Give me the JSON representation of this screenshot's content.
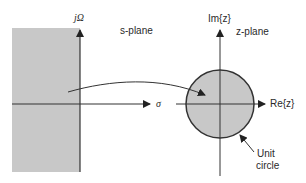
{
  "s_plane": {
    "title": "s-plane",
    "imag_axis_label": "jΩ",
    "real_axis_label": "σ",
    "shaded_region": "left-half plane",
    "shade_color": "#c8c8c8"
  },
  "z_plane": {
    "title": "z-plane",
    "imag_axis_label": "Im{z}",
    "real_axis_label": "Re{z}",
    "circle_label_line1": "Unit",
    "circle_label_line2": "circle",
    "circle_fill": "#c8c8c8",
    "circle_stroke": "#333333"
  },
  "mapping_arrow": {
    "description": "maps left-half s-plane to interior of unit circle"
  },
  "colors": {
    "axis": "#333333",
    "shade": "#c8c8c8",
    "background": "#ffffff"
  }
}
